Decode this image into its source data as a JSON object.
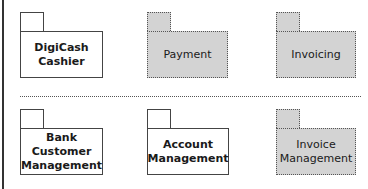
{
  "diagram": {
    "type": "uml-package-diagram",
    "top_row": [
      {
        "name": "DigiCash\nCashier",
        "lines": [
          "DigiCash",
          "Cashier"
        ],
        "style": "solid"
      },
      {
        "name": "Payment",
        "lines": [
          "Payment"
        ],
        "style": "dotted-shaded"
      },
      {
        "name": "Invoicing",
        "lines": [
          "Invoicing"
        ],
        "style": "dotted-shaded"
      }
    ],
    "bottom_row": [
      {
        "name": "Bank Customer Management",
        "lines": [
          "Bank Customer",
          "Management"
        ],
        "style": "solid"
      },
      {
        "name": "Account Management",
        "lines": [
          "Account",
          "Management"
        ],
        "style": "solid"
      },
      {
        "name": "Invoice Management",
        "lines": [
          "Invoice",
          "Management"
        ],
        "style": "dotted-shaded"
      }
    ],
    "colors": {
      "shaded_fill": "#d3d3d3",
      "line": "#444444",
      "background": "#ffffff"
    }
  }
}
